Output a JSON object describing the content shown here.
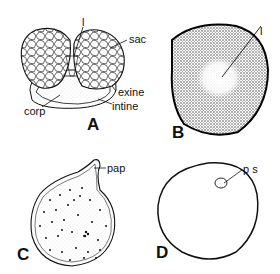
{
  "figure": {
    "panels": [
      {
        "id": "A",
        "label": "A",
        "annotations": [
          "l",
          "sac",
          "exine",
          "intine",
          "corp"
        ]
      },
      {
        "id": "B",
        "label": "B",
        "annotations": [
          "l"
        ]
      },
      {
        "id": "C",
        "label": "C",
        "annotations": [
          "pap"
        ]
      },
      {
        "id": "D",
        "label": "D",
        "annotations": [
          "p s"
        ]
      }
    ]
  },
  "labels": {
    "a_l": "l",
    "a_sac": "sac",
    "a_exine": "exine",
    "a_intine": "intine",
    "a_corp": "corp",
    "a_panel": "A",
    "b_l": "l",
    "b_panel": "B",
    "c_pap": "pap",
    "c_panel": "C",
    "d_ps": "p s",
    "d_panel": "D"
  }
}
